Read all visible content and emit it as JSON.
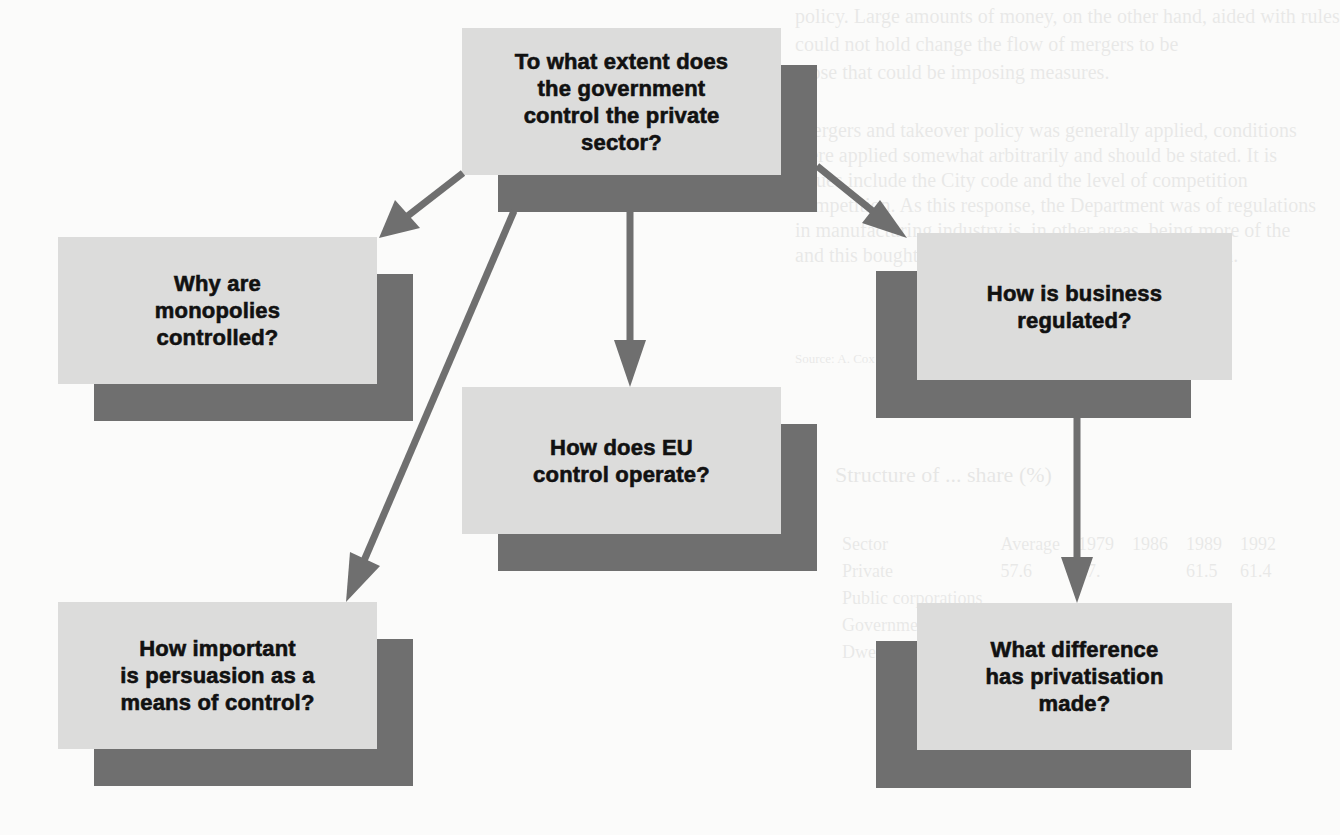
{
  "diagram": {
    "colors": {
      "box_face": "#dcdcdb",
      "box_shadow": "#6f6f6f",
      "arrow": "#6f6f6f",
      "text": "#111111",
      "background": "#fbfbfa"
    },
    "root": {
      "id": "root",
      "label": "To what extent does\nthe government\ncontrol the private\nsector?"
    },
    "nodes": [
      {
        "id": "monopolies",
        "label": "Why are\nmonopolies\ncontrolled?"
      },
      {
        "id": "eu",
        "label": "How does EU\ncontrol operate?"
      },
      {
        "id": "regulation",
        "label": "How is business\nregulated?"
      },
      {
        "id": "persuasion",
        "label": "How important\nis persuasion as a\nmeans of control?"
      },
      {
        "id": "privatisation",
        "label": "What difference\nhas privatisation\nmade?"
      }
    ],
    "edges": [
      {
        "from": "root",
        "to": "monopolies"
      },
      {
        "from": "root",
        "to": "persuasion"
      },
      {
        "from": "root",
        "to": "eu"
      },
      {
        "from": "root",
        "to": "regulation"
      },
      {
        "from": "regulation",
        "to": "privatisation"
      }
    ]
  },
  "background_showthrough": {
    "lines": [
      "policy. Large amounts of money, on the other hand, aided with rules",
      "could not hold change the flow of mergers to be",
      "those that could be imposing measures.",
      "Mergers and takeover policy was generally applied, conditions",
      "were applied somewhat arbitrarily and should be stated. It is",
      "issues include the City code and the level of competition",
      "competition. As this response, the Department was of regulations",
      "in manufacturing industry is, in other areas, being more of the",
      "and this bought great ... and ... rather than deregulation."
    ],
    "caption": "Source: A. Cox and others, Privatisation ...",
    "table_title": "Structure of ... share (%)",
    "table_header": [
      "Sector",
      "",
      "",
      "Average",
      "1979",
      "1986",
      "1989",
      "1992"
    ],
    "table_rows": [
      [
        "Private",
        "57.6",
        "",
        "57.",
        "",
        "",
        "61.5",
        "61.4"
      ],
      [
        "Public corporations",
        "",
        "",
        "",
        "",
        "",
        "",
        ""
      ],
      [
        "Government",
        "",
        "",
        "",
        "",
        "",
        "",
        ""
      ],
      [
        "Dwellings",
        "",
        "",
        "",
        "",
        "",
        "",
        ""
      ]
    ],
    "table_source": "Source: CSO ..."
  }
}
